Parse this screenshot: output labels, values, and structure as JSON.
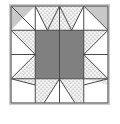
{
  "figure": {
    "kind": "quilt-block-diagram",
    "canvas": {
      "width": 120,
      "height": 124
    }
  },
  "block": {
    "name": "star-quilt-block",
    "x": 11,
    "y": 6,
    "size": 97,
    "grid_divisions": 4,
    "cell_size": 24.25
  },
  "colors": {
    "background": "#ffffff",
    "outline": "#4a4a4a",
    "grid_line": "#5a5a5a",
    "center_fill": "#808080",
    "corner_fill": "#c8c8c8",
    "stipple_base": "#f0f0f0",
    "stipple_dot": "#8a8a8a",
    "white_fill": "#ffffff",
    "border_outer": "#9a9a9a"
  },
  "legend": {
    "center_label": "center square",
    "corner_label": "corner triangle",
    "stipple_label": "stippled point",
    "white_label": "plain white"
  },
  "patches": [
    {
      "name": "corner-top-left-gray-triangle",
      "fill": "corner",
      "points": "0,0 1,0 0,1"
    },
    {
      "name": "corner-top-left-white-triangle",
      "fill": "white",
      "points": "1,0 1,1 0,1"
    },
    {
      "name": "top-inner-left-stipple-left",
      "fill": "stipple",
      "points": "1,0 2,0 2,1"
    },
    {
      "name": "top-inner-left-white-point",
      "fill": "white",
      "points": "1,0 2,1 1,1"
    },
    {
      "name": "top-inner-right-stipple-right",
      "fill": "stipple",
      "points": "3,0 3,1 2,0"
    },
    {
      "name": "top-inner-right-white-point",
      "fill": "white",
      "points": "3,0 3,1 2,1"
    },
    {
      "name": "corner-top-right-gray-triangle",
      "fill": "corner",
      "points": "3,0 4,0 4,1"
    },
    {
      "name": "corner-top-right-white-triangle",
      "fill": "white",
      "points": "3,0 4,1 3,1"
    },
    {
      "name": "left-upper-stipple-top",
      "fill": "stipple",
      "points": "0,1 1,1 0,2"
    },
    {
      "name": "left-upper-white-point",
      "fill": "white",
      "points": "0,1 1,2 0,2"
    },
    {
      "name": "left-lower-stipple-bottom",
      "fill": "stipple",
      "points": "0,2 1,2 0,3"
    },
    {
      "name": "left-lower-white-point",
      "fill": "white",
      "points": "0,3 1,2 0,2"
    },
    {
      "name": "right-upper-stipple-top",
      "fill": "stipple",
      "points": "3,1 4,1 4,2"
    },
    {
      "name": "right-upper-white-point",
      "fill": "white",
      "points": "4,1 4,2 3,2"
    },
    {
      "name": "right-lower-stipple-bottom",
      "fill": "stipple",
      "points": "4,2 4,3 3,2"
    },
    {
      "name": "right-lower-white-point",
      "fill": "white",
      "points": "4,2 4,3 3,2"
    },
    {
      "name": "center-square",
      "fill": "center",
      "points": "1,1 3,1 3,3 1,3"
    },
    {
      "name": "corner-bottom-left-stipple",
      "fill": "stipple",
      "points": "0,3 1,3 1,4"
    },
    {
      "name": "corner-bottom-left-white",
      "fill": "white",
      "points": "0,3 1,4 0,4"
    },
    {
      "name": "bottom-inner-left-stipple",
      "fill": "stipple",
      "points": "1,3 2,3 1,4"
    },
    {
      "name": "bottom-inner-left-white-point",
      "fill": "white",
      "points": "1,4 2,3 2,4"
    },
    {
      "name": "bottom-inner-right-stipple",
      "fill": "stipple",
      "points": "2,3 3,3 3,4"
    },
    {
      "name": "bottom-inner-right-white-point",
      "fill": "white",
      "points": "2,3 2,4 3,4"
    },
    {
      "name": "corner-bottom-right-stipple",
      "fill": "stipple",
      "points": "3,3 4,3 3,4"
    },
    {
      "name": "corner-bottom-right-white",
      "fill": "white",
      "points": "3,4 4,3 4,4"
    }
  ]
}
